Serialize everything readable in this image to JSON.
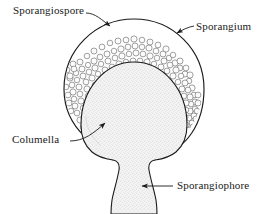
{
  "figure": {
    "width": 269,
    "height": 214,
    "background_color": "#ffffff",
    "ink_color": "#1a1a1a"
  },
  "labels": {
    "sporangiospore": "Sporangiospore",
    "sporangium": "Sporangium",
    "columella": "Columella",
    "sporangiophore": "Sporangiophore"
  },
  "diagram_data": {
    "type": "diagram",
    "style": "ink line drawing with stipple shading",
    "parts": [
      {
        "name": "sporangium",
        "label": "Sporangium",
        "description": "outer spherical sac enclosing the spore mass",
        "shape": "sphere",
        "center": [
          134,
          88
        ],
        "radius": 69,
        "fill": "#ffffff",
        "stroke": "#1a1a1a"
      },
      {
        "name": "sporangiospore",
        "label": "Sporangiospore",
        "description": "dense layer of small round spores filling the space between sporangium wall and columella",
        "shape": "packed-circles",
        "spore_radius_px": 3,
        "spore_count": 230,
        "fill": "#fdfdfd",
        "stroke": "#4a4a4a"
      },
      {
        "name": "columella",
        "label": "Columella",
        "description": "large dome-shaped sterile structure at the centre, continuous with the stalk",
        "shape": "dome",
        "center": [
          134,
          125
        ],
        "radius_x": 52,
        "radius_y": 62,
        "fill": "#f2f2f2",
        "stroke": "#1a1a1a"
      },
      {
        "name": "sporangiophore",
        "label": "Sporangiophore",
        "description": "stalk bearing the sporangium, flaring where it meets the columella",
        "shape": "stalk",
        "top_width": 120,
        "waist_width": 40,
        "bottom_width": 48,
        "fill": "#f2f2f2",
        "stroke": "#1a1a1a"
      }
    ],
    "leader_lines": [
      {
        "label": "Sporangiospore",
        "from": [
          104,
          15
        ],
        "to": [
          113,
          28
        ],
        "arrow": true
      },
      {
        "label": "Sporangium",
        "from": [
          193,
          26
        ],
        "to": [
          176,
          33
        ],
        "arrow": true
      },
      {
        "label": "Columella",
        "from": [
          72,
          140
        ],
        "to": [
          109,
          120
        ],
        "arrow": true
      },
      {
        "label": "Sporangiophore",
        "from": [
          172,
          186
        ],
        "to": [
          140,
          186
        ],
        "arrow": true
      }
    ]
  }
}
